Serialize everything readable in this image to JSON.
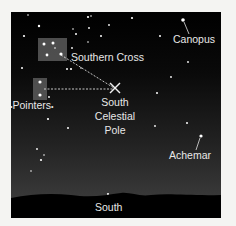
{
  "diagram": {
    "colors": {
      "sky_top": "#000000",
      "sky_bottom": "#393939",
      "horizon": "#000000",
      "star": "#ffffff",
      "label": "#e8e8e8",
      "highlight_box": "#5a5a5a",
      "background": "#f4f4f2"
    },
    "labels": {
      "southern_cross": "Southern Cross",
      "canopus": "Canopus",
      "pointers": "Pointers",
      "south_celestial_pole_line1": "South",
      "south_celestial_pole_line2": "Celestial",
      "south_celestial_pole_line3": "Pole",
      "achemar": "Achemar",
      "horizon_direction": "South"
    },
    "markers": {
      "south_celestial_pole": "x-marker"
    }
  }
}
